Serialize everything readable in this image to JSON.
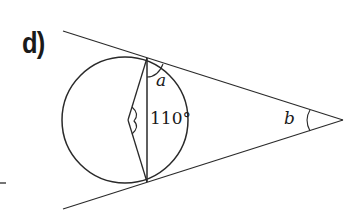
{
  "figure": {
    "part_label": "d)",
    "angle_labels": {
      "a": "a",
      "b": "b",
      "given_angle": "110°"
    },
    "colors": {
      "stroke": "#2a2a2a",
      "text": "#1a1a1a",
      "background": "#ffffff"
    }
  }
}
